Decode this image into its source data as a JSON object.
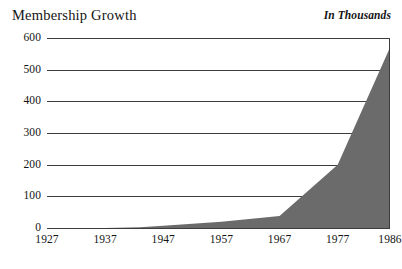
{
  "header": {
    "title": "Membership Growth",
    "units_note": "In Thousands"
  },
  "chart_data": {
    "type": "area",
    "title": "Membership Growth",
    "subtitle": "In Thousands",
    "xlabel": "",
    "ylabel": "",
    "units": "Thousands",
    "xlim": [
      1927,
      1986
    ],
    "ylim": [
      0,
      600
    ],
    "grid": true,
    "legend": false,
    "series_color": "#6b6b6b",
    "x_tick_labels": [
      "1927",
      "1937",
      "1947",
      "1957",
      "1967",
      "1977",
      "1986"
    ],
    "x_ticks": [
      1927,
      1937,
      1947,
      1957,
      1967,
      1977,
      1986
    ],
    "y_tick_labels": [
      "600",
      "500",
      "400",
      "300",
      "200",
      "100",
      "0"
    ],
    "y_ticks": [
      600,
      500,
      400,
      300,
      200,
      100,
      0
    ],
    "x": [
      1927,
      1937,
      1943,
      1947,
      1957,
      1967,
      1977,
      1986
    ],
    "values": [
      0,
      0,
      2,
      7,
      20,
      38,
      200,
      570
    ],
    "series": [
      {
        "name": "Membership",
        "x": [
          1927,
          1937,
          1943,
          1947,
          1957,
          1967,
          1977,
          1986
        ],
        "values": [
          0,
          0,
          2,
          7,
          20,
          38,
          200,
          570
        ]
      }
    ],
    "annotations": []
  }
}
